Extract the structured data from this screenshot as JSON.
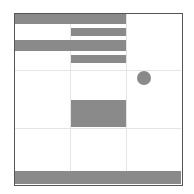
{
  "layout": {
    "type": "wireframe-grid",
    "columns": 3,
    "rows": 3
  },
  "colors": {
    "block": "#8a8a8a",
    "frame": "#555555",
    "grid": "#e4e4e4",
    "background": "#ffffff"
  },
  "elements": [
    {
      "name": "header-bar-1",
      "shape": "rect"
    },
    {
      "name": "header-bar-2",
      "shape": "rect"
    },
    {
      "name": "header-bar-3",
      "shape": "rect"
    },
    {
      "name": "header-bar-4",
      "shape": "rect"
    },
    {
      "name": "status-dot",
      "shape": "circle"
    },
    {
      "name": "content-block",
      "shape": "rect"
    },
    {
      "name": "footer-bar",
      "shape": "rect"
    }
  ]
}
